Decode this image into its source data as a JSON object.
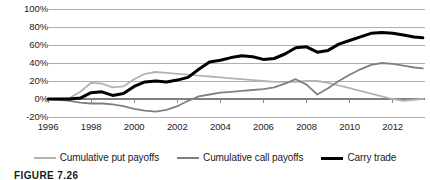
{
  "chart_data": {
    "type": "line",
    "title": "",
    "xlabel": "",
    "ylabel": "",
    "xlim": [
      1996,
      2013.5
    ],
    "ylim": [
      -20,
      100
    ],
    "grid": true,
    "grid_axis": "y",
    "legend_position": "bottom",
    "y_ticks": [
      100,
      80,
      60,
      40,
      20,
      0,
      -20
    ],
    "y_tick_labels": [
      "100%",
      "80%",
      "60%",
      "40%",
      "20%",
      "0%",
      "-20%"
    ],
    "x_ticks": [
      1996,
      1998,
      2000,
      2002,
      2004,
      2006,
      2008,
      2010,
      2012
    ],
    "x_tick_labels": [
      "1996",
      "1998",
      "2000",
      "2002",
      "2004",
      "2006",
      "2008",
      "2010",
      "2012"
    ],
    "series": [
      {
        "name": "Cumulative put payoffs",
        "color": "#b3b3b3",
        "width": 1.8,
        "x": [
          1996,
          1996.5,
          1997,
          1997.5,
          1998,
          1998.5,
          1999,
          1999.5,
          2000,
          2000.5,
          2001,
          2001.5,
          2002,
          2002.5,
          2003,
          2003.5,
          2004,
          2004.5,
          2005,
          2005.5,
          2006,
          2006.5,
          2007,
          2007.5,
          2008,
          2008.5,
          2009,
          2009.5,
          2010,
          2010.5,
          2011,
          2011.5,
          2012,
          2012.5,
          2013,
          2013.4
        ],
        "y": [
          0,
          0,
          1,
          8,
          18,
          17,
          13,
          14,
          22,
          28,
          30,
          29,
          28,
          27,
          26,
          25,
          24,
          23,
          22,
          21,
          20,
          19,
          19,
          19,
          20,
          20,
          18,
          15,
          12,
          9,
          6,
          3,
          0,
          -2,
          -1,
          0
        ]
      },
      {
        "name": "Cumulative call payoffs",
        "color": "#808080",
        "width": 1.8,
        "x": [
          1996,
          1996.5,
          1997,
          1997.5,
          1998,
          1998.5,
          1999,
          1999.5,
          2000,
          2000.5,
          2001,
          2001.5,
          2002,
          2002.5,
          2003,
          2003.5,
          2004,
          2004.5,
          2005,
          2005.5,
          2006,
          2006.5,
          2007,
          2007.5,
          2008,
          2008.5,
          2009,
          2009.5,
          2010,
          2010.5,
          2011,
          2011.5,
          2012,
          2012.5,
          2013,
          2013.4
        ],
        "y": [
          0,
          -1,
          -2,
          -4,
          -5,
          -5,
          -6,
          -8,
          -11,
          -13,
          -14,
          -12,
          -8,
          -2,
          3,
          5,
          7,
          8,
          9,
          10,
          11,
          13,
          17,
          22,
          16,
          5,
          12,
          20,
          27,
          33,
          38,
          40,
          39,
          37,
          35,
          34
        ]
      },
      {
        "name": "Carry trade",
        "color": "#000000",
        "width": 3.0,
        "x": [
          1996,
          1996.5,
          1997,
          1997.5,
          1998,
          1998.5,
          1999,
          1999.5,
          2000,
          2000.5,
          2001,
          2001.5,
          2002,
          2002.5,
          2003,
          2003.5,
          2004,
          2004.5,
          2005,
          2005.5,
          2006,
          2006.5,
          2007,
          2007.5,
          2008,
          2008.5,
          2009,
          2009.5,
          2010,
          2010.5,
          2011,
          2011.5,
          2012,
          2012.5,
          2013,
          2013.4
        ],
        "y": [
          0,
          0,
          0,
          1,
          7,
          8,
          4,
          6,
          14,
          19,
          20,
          19,
          21,
          24,
          33,
          41,
          43,
          46,
          48,
          47,
          44,
          45,
          50,
          57,
          58,
          52,
          54,
          61,
          65,
          69,
          73,
          74,
          73,
          71,
          69,
          68
        ]
      }
    ]
  },
  "legend": {
    "items": [
      {
        "label": "Cumulative put payoffs",
        "color": "#b3b3b3",
        "thickness": 2
      },
      {
        "label": "Cumulative call payoffs",
        "color": "#808080",
        "thickness": 2
      },
      {
        "label": "Carry trade",
        "color": "#000000",
        "thickness": 3
      }
    ]
  },
  "caption": {
    "text": "FIGURE 7.26"
  },
  "style": {
    "gridline_color": "#a6a6a6",
    "zero_line_color": "#808080",
    "background": "#ffffff"
  }
}
